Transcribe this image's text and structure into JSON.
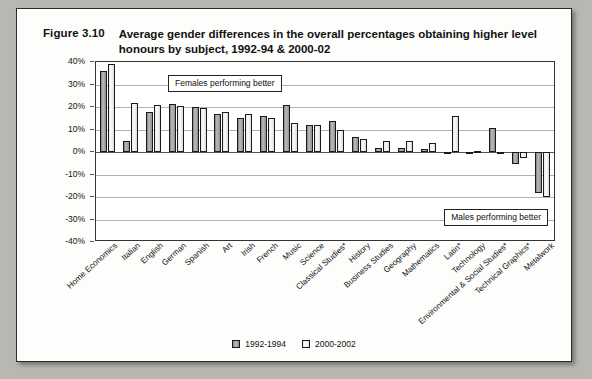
{
  "figure": {
    "number": "Figure 3.10",
    "title": "Average gender differences in the overall percentages obtaining higher level honours by subject, 1992-94 & 2000-02"
  },
  "annotations": {
    "females": "Females performing better",
    "males": "Males performing better"
  },
  "legend": {
    "items": [
      {
        "label": "1992-1994",
        "color": "#9a9a9a"
      },
      {
        "label": "2000-2002",
        "color": "#f2f2f2"
      }
    ]
  },
  "chart_data": {
    "type": "bar",
    "title": "Average gender differences in the overall percentages obtaining higher level honours by subject, 1992-94 & 2000-02",
    "xlabel": "",
    "ylabel": "",
    "ylim": [
      -40,
      40
    ],
    "ytick_labels": [
      "40%",
      "30%",
      "20%",
      "10%",
      "0%",
      "-10%",
      "-20%",
      "-30%",
      "-40%"
    ],
    "ytick_values": [
      40,
      30,
      20,
      10,
      0,
      -10,
      -20,
      -30,
      -40
    ],
    "grid": true,
    "legend_position": "bottom",
    "categories": [
      "Home Economics",
      "Italian",
      "English",
      "German",
      "Spanish",
      "Art",
      "Irish",
      "French",
      "Music",
      "Science",
      "Classical Studies*",
      "History",
      "Business Studies",
      "Geography",
      "Mathematics",
      "Latin*",
      "Technology",
      "Environmental & Social Studies*",
      "Technical Graphics*",
      "Metalwork"
    ],
    "series": [
      {
        "name": "1992-1994",
        "values": [
          36,
          5,
          18,
          21.5,
          20,
          17,
          15,
          16,
          21,
          12,
          14,
          6.5,
          2,
          2,
          1.5,
          0,
          -0.5,
          10.5,
          -5.5,
          -18
        ]
      },
      {
        "name": "2000-2002",
        "values": [
          39,
          22,
          21,
          20.5,
          19.5,
          18,
          17,
          15,
          13,
          12,
          10,
          6,
          5,
          5,
          4,
          16,
          0.5,
          -0.5,
          -2.5,
          -20
        ]
      }
    ]
  }
}
